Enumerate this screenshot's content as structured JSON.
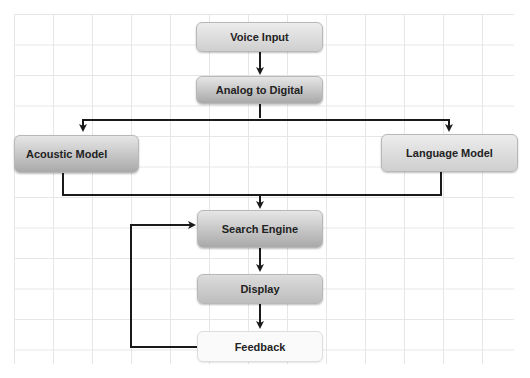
{
  "diagram": {
    "nodes": [
      {
        "id": "voice_input",
        "label": "Voice Input"
      },
      {
        "id": "analog_to_digital",
        "label": "Analog to Digital"
      },
      {
        "id": "acoustic_model",
        "label": "Acoustic Model"
      },
      {
        "id": "language_model",
        "label": "Language Model"
      },
      {
        "id": "search_engine",
        "label": "Search Engine"
      },
      {
        "id": "display",
        "label": "Display"
      },
      {
        "id": "feedback",
        "label": "Feedback"
      }
    ],
    "edges": [
      {
        "from": "voice_input",
        "to": "analog_to_digital"
      },
      {
        "from": "analog_to_digital",
        "to": "acoustic_model"
      },
      {
        "from": "analog_to_digital",
        "to": "language_model"
      },
      {
        "from": "acoustic_model",
        "to": "search_engine"
      },
      {
        "from": "language_model",
        "to": "search_engine"
      },
      {
        "from": "search_engine",
        "to": "display"
      },
      {
        "from": "display",
        "to": "feedback"
      },
      {
        "from": "feedback",
        "to": "search_engine"
      }
    ],
    "colors": {
      "edge": "#1a1a1a",
      "grid": "#e6e6e6",
      "node_fill": "#cfcfcf",
      "feedback_fill": "#fafafa"
    }
  }
}
